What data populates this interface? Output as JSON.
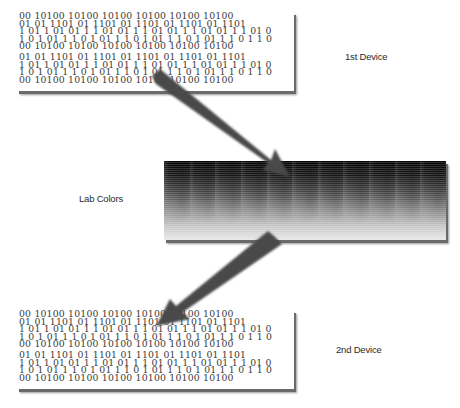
{
  "diagram": {
    "labels": {
      "first_device": "1st Device",
      "lab_colors": "Lab Colors",
      "second_device": "2nd Device"
    },
    "first_device_data": {
      "groups": [
        [
          "00 10100 10100 10100 10100 10100 10100",
          "01 01 1101 01 1101 01 1101 01 1101 01 1101",
          "1 01 1 01 01 1 1 01 01 1 1 01 01 1 1 01 01 1 1 01 0",
          "1 0 1 01 1 1 0 1 01 1 1 0 1 01 1 1 0 1 01 1 1 0 1 1 0",
          "00 10100 10100 10100 10100 10100 10100"
        ],
        [
          "01 01 1101 01 1101 01 1101 01 1101 01 1101",
          "1 01 1 01 01 1 1 01 01 1 1 01 01 1 1 01 01 1 1 01 0",
          "1 0 1 01 1 1 0 1 01 1 1 0 1 01 1 1 0 1 01 1 1 0 1 1 0",
          "00 10100 10100 10100 10100 10100 10100"
        ]
      ]
    },
    "second_device_data": {
      "groups": [
        [
          "00 10100 10100 10100 10100 10100 10100",
          "01 01 1101 01 1101 01 1101 01 1101 01 1101",
          "1 01 1 01 01 1 1 01 01 1 1 01 01 1 1 01 01 1 1 01 0",
          "1 0 1 01 1 1 0 1 01 1 1 0 1 01 1 1 0 1 01 1 1 0 1 1 0",
          "00 10100 10100 10100 10100 10100 10100"
        ],
        [
          "01 01 1101 01 1101 01 1101 01 1101 01 1101",
          "1 01 1 01 01 1 1 01 01 1 1 01 01 1 1 01 01 1 1 01 0",
          "1 0 1 01 1 1 0 1 01 1 1 0 1 01 1 1 0 1 01 1 1 0 1 1 0",
          "00 10100 10100 10100 10100 10100 10100"
        ]
      ]
    },
    "lab_box": {
      "columns": 11,
      "gradient": "black-to-white vertical"
    },
    "arrows": [
      {
        "from": "first_device",
        "to": "lab_colors"
      },
      {
        "from": "lab_colors",
        "to": "second_device"
      }
    ],
    "colors": {
      "arrow": "#4a4a4a",
      "text": "#2a2a2a",
      "shadow": "#6a6a6a"
    }
  }
}
